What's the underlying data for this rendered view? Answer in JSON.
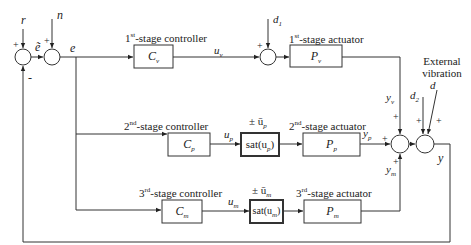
{
  "diagram": {
    "type": "block-diagram",
    "inputs": {
      "reference": "r",
      "noise": "n",
      "disturbance_1": "d",
      "disturbance_1_sub": "1",
      "disturbance_2": "d",
      "disturbance_2_sub": "2",
      "external_vibration": "d",
      "external_vibration_label_line1": "External",
      "external_vibration_label_line2": "vibration"
    },
    "signals": {
      "e_tilde": "ẽ",
      "e": "e",
      "u_v": "u",
      "u_v_sub": "v",
      "u_p": "u",
      "u_p_sub": "p",
      "u_m": "u",
      "u_m_sub": "m",
      "y_v": "y",
      "y_v_sub": "v",
      "y_p": "y",
      "y_p_sub": "p",
      "y_m": "y",
      "y_m_sub": "m",
      "y": "y"
    },
    "stages": [
      {
        "controller_label": "1st-stage controller",
        "controller_ord": "1",
        "controller_sup": "st",
        "controller_rest": "-stage controller",
        "controller": "C",
        "controller_sub": "v",
        "actuator_label": "1st-stage actuator",
        "actuator_ord": "1",
        "actuator_sup": "st",
        "actuator_rest": "-stage actuator",
        "actuator": "P",
        "actuator_sub": "v"
      },
      {
        "controller_ord": "2",
        "controller_sup": "nd",
        "controller_rest": "-stage controller",
        "controller": "C",
        "controller_sub": "p",
        "saturation": "sat(u",
        "saturation_sub": "p",
        "saturation_close": ")",
        "saturation_limit": "± ū",
        "saturation_limit_sub": "p",
        "actuator_ord": "2",
        "actuator_sup": "nd",
        "actuator_rest": "-stage actuator",
        "actuator": "P",
        "actuator_sub": "p"
      },
      {
        "controller_ord": "3",
        "controller_sup": "rd",
        "controller_rest": "-stage controller",
        "controller": "C",
        "controller_sub": "m",
        "saturation": "sat(u",
        "saturation_sub": "m",
        "saturation_close": ")",
        "saturation_limit": "± ū",
        "saturation_limit_sub": "m",
        "actuator_ord": "3",
        "actuator_sup": "rd",
        "actuator_rest": "-stage actuator",
        "actuator": "P",
        "actuator_sub": "m"
      }
    ],
    "signs": {
      "plus": "+",
      "minus": "-"
    }
  }
}
